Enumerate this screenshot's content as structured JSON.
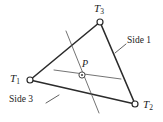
{
  "figure": {
    "caption": "",
    "background_color": "#ffffff",
    "edge_color": "#2b2b2b",
    "cevian_color": "#5a5a5a",
    "label_color": "#1c1c1c",
    "width": 163,
    "height": 122
  },
  "vertices": [
    {
      "id": "T1",
      "base": "T",
      "sub": "1",
      "label": "T1",
      "x": 30,
      "y": 80,
      "label_x": 10,
      "label_y": 73
    },
    {
      "id": "T2",
      "base": "T",
      "sub": "2",
      "label": "T2",
      "x": 135,
      "y": 104,
      "label_x": 143,
      "label_y": 99
    },
    {
      "id": "T3",
      "base": "T",
      "sub": "3",
      "label": "T3",
      "x": 100,
      "y": 22,
      "label_x": 94,
      "label_y": 3
    }
  ],
  "interior_point": {
    "id": "P",
    "label": "P",
    "x": 82,
    "y": 75,
    "label_x": 82,
    "label_y": 59
  },
  "cevians": [
    {
      "name": "steep-line",
      "x1": 66,
      "y1": 31,
      "x2": 99,
      "y2": 113
    },
    {
      "name": "shallow-line",
      "x1": 54,
      "y1": 70,
      "x2": 121,
      "y2": 79
    }
  ],
  "side_labels": [
    {
      "id": "side1",
      "text": "Side 1",
      "label_x": 127,
      "label_y": 36,
      "leader_x1": 126,
      "leader_y1": 44,
      "leader_x2": 115,
      "leader_y2": 53
    },
    {
      "id": "side3",
      "text": "Side 3",
      "label_x": 9,
      "label_y": 95,
      "leader_x1": 46,
      "leader_y1": 103,
      "leader_x2": 59,
      "leader_y2": 95
    }
  ]
}
